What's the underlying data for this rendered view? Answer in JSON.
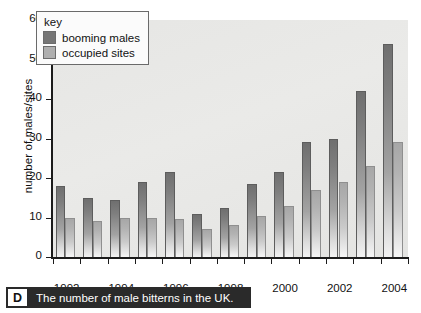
{
  "caption": {
    "badge": "D",
    "text": "The number of male bitterns in the UK."
  },
  "legend": {
    "title": "key",
    "entries": [
      {
        "label": "booming males",
        "color": "#767676"
      },
      {
        "label": "occupied sites",
        "color": "#afafaf"
      }
    ]
  },
  "colors": {
    "booming_males": "#767676",
    "occupied_sites": "#afafaf",
    "plot_background": "#e8e8e6",
    "axis": "#1b1b1b",
    "caption_background": "#2a2a2a"
  },
  "chart_data": {
    "type": "bar",
    "title": "",
    "subtitle": "",
    "xlabel": "",
    "ylabel": "number of males/sites",
    "categories": [
      1992,
      1993,
      1994,
      1995,
      1996,
      1997,
      1998,
      1999,
      2000,
      2001,
      2002,
      2003,
      2004
    ],
    "x_tick_labels": [
      "1992",
      "1994",
      "1996",
      "1998",
      "2000",
      "2002",
      "2004"
    ],
    "y_tick_labels": [
      "0",
      "10",
      "20",
      "30",
      "40",
      "50",
      "60"
    ],
    "ylim": [
      0,
      60
    ],
    "y_ticks": [
      0,
      10,
      20,
      30,
      40,
      50,
      60
    ],
    "grid": false,
    "legend_position": "upper-left-inside",
    "series": [
      {
        "name": "booming males",
        "color": "#767676",
        "values": [
          18,
          15,
          14.5,
          19,
          21.5,
          11,
          12.5,
          18.5,
          21.5,
          29,
          30,
          42,
          54
        ]
      },
      {
        "name": "occupied sites",
        "color": "#afafaf",
        "values": [
          10,
          9,
          10,
          10,
          9.5,
          7,
          8,
          10.5,
          13,
          17,
          19,
          23,
          29
        ]
      }
    ]
  }
}
